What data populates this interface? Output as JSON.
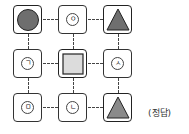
{
  "grid": {
    "cells": [
      {
        "row": 0,
        "col": 0,
        "type": "shape",
        "shape": "circle",
        "fill": "#6e6e6e"
      },
      {
        "row": 0,
        "col": 1,
        "type": "label",
        "text": "ㅇ"
      },
      {
        "row": 0,
        "col": 2,
        "type": "shape",
        "shape": "triangle",
        "fill": "#6f6f6f"
      },
      {
        "row": 1,
        "col": 0,
        "type": "label",
        "text": "ㄱ"
      },
      {
        "row": 1,
        "col": 1,
        "type": "shape",
        "shape": "square",
        "fill": "#dcdcdc"
      },
      {
        "row": 1,
        "col": 2,
        "type": "label",
        "text": "ㅅ"
      },
      {
        "row": 2,
        "col": 0,
        "type": "label",
        "text": "ㅁ"
      },
      {
        "row": 2,
        "col": 1,
        "type": "label",
        "text": "ㄴ"
      },
      {
        "row": 2,
        "col": 2,
        "type": "shape",
        "shape": "triangle",
        "fill": "#8a8a8a"
      }
    ],
    "connectors": "dashed"
  },
  "labels": {
    "c01": "ㅇ",
    "c10": "ㄱ",
    "c12": "ㅅ",
    "c20": "ㅁ",
    "c21": "ㄴ"
  },
  "caption": "(정답)"
}
